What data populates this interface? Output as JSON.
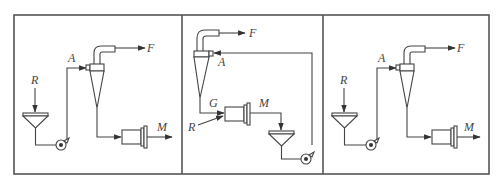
{
  "figure": {
    "panels": [
      {
        "id": "panel-1",
        "labels": {
          "feed": "R",
          "cyclone_feed": "A",
          "overflow": "F",
          "product": "M"
        },
        "config": "open-circuit: feed to sump, pumped to hydrocyclone, underflow to mill"
      },
      {
        "id": "panel-2",
        "labels": {
          "feed": "R",
          "cyclone_feed": "A",
          "overflow": "F",
          "underflow": "G",
          "mill_discharge": "M"
        },
        "config": "closed-circuit: mill discharge to sump, pumped to hydrocyclone, underflow returns to mill"
      },
      {
        "id": "panel-3",
        "labels": {
          "feed": "R",
          "cyclone_feed": "A",
          "overflow": "F",
          "product": "M"
        },
        "config": "open-circuit: feed to sump, pumped to hydrocyclone, underflow to mill"
      }
    ],
    "colors": {
      "stroke": "#444444",
      "frame": "#555555",
      "background": "#ffffff"
    }
  }
}
